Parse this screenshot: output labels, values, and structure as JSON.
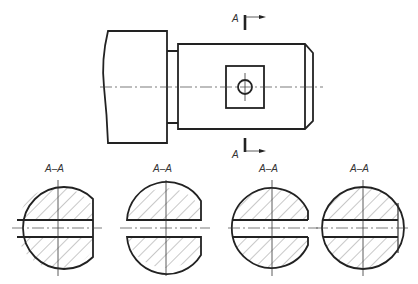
{
  "drawing": {
    "type": "engineering-drawing",
    "main_view": {
      "section_mark_top_label": "A",
      "section_mark_bottom_label": "A"
    },
    "sections": [
      {
        "label": "A–A",
        "variant": "slot-through-flat-right"
      },
      {
        "label": "A–A",
        "variant": "split-open-slot"
      },
      {
        "label": "A–A",
        "variant": "slot-open-right"
      },
      {
        "label": "A–A",
        "variant": "slot-through-chamfer-line"
      }
    ]
  }
}
